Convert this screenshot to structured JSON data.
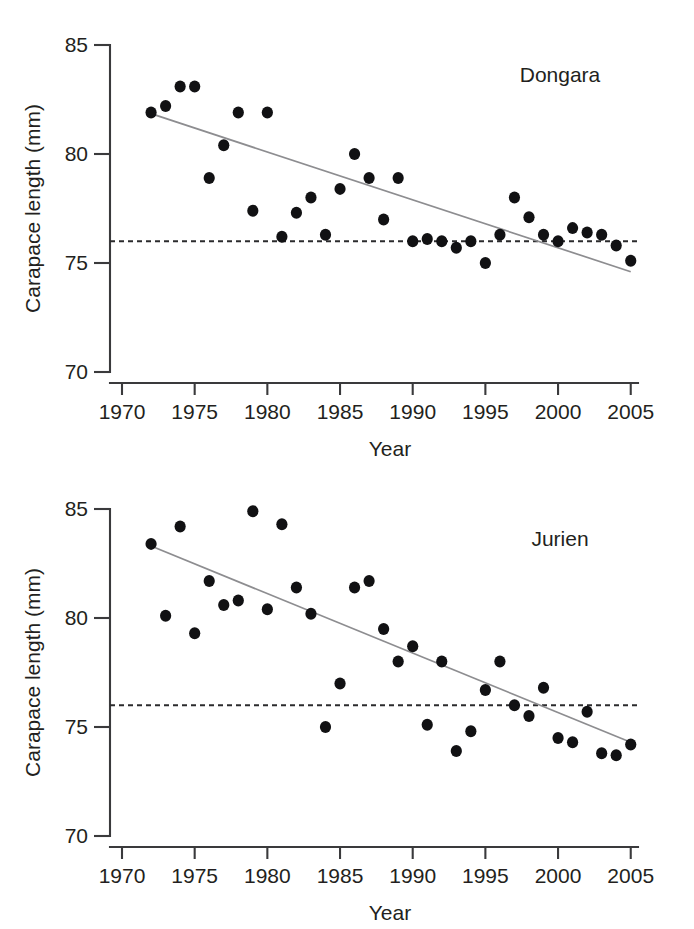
{
  "figure": {
    "background_color": "#ffffff",
    "point_color": "#111113",
    "trend_color": "#8d8d90",
    "reference_color": "#2b2b2d",
    "axis_color": "#3a3a3c"
  },
  "chart_data": [
    {
      "type": "scatter",
      "title": "Dongara",
      "xlabel": "Year",
      "ylabel": "Carapace length (mm)",
      "xlim": [
        1970,
        2005.5
      ],
      "ylim": [
        70,
        85
      ],
      "xticks": [
        1970,
        1975,
        1980,
        1985,
        1990,
        1995,
        2000,
        2005
      ],
      "xtick_labels": [
        "1970",
        "1975",
        "1980",
        "1985",
        "1990",
        "1995",
        "2000",
        "2005"
      ],
      "yticks": [
        70,
        75,
        80,
        85
      ],
      "ytick_labels": [
        "70",
        "75",
        "80",
        "85"
      ],
      "grid": false,
      "legend": "none",
      "x": [
        1972,
        1973,
        1974,
        1975,
        1976,
        1977,
        1978,
        1979,
        1980,
        1981,
        1982,
        1983,
        1984,
        1985,
        1986,
        1987,
        1988,
        1989,
        1990,
        1991,
        1992,
        1993,
        1994,
        1995,
        1996,
        1997,
        1998,
        1999,
        2000,
        2001,
        2002,
        2003,
        2004,
        2005
      ],
      "y": [
        81.9,
        82.2,
        83.1,
        83.1,
        78.9,
        80.4,
        81.9,
        77.4,
        81.9,
        76.2,
        77.3,
        78.0,
        76.3,
        78.4,
        80.0,
        78.9,
        77.0,
        78.9,
        76.0,
        76.1,
        76.0,
        75.7,
        76.0,
        75.0,
        76.3,
        78.0,
        77.1,
        76.3,
        76.0,
        76.6,
        76.4,
        76.3,
        75.8,
        75.1
      ],
      "trend_line": {
        "x": [
          1972,
          2005
        ],
        "y": [
          81.85,
          74.6
        ],
        "label": "linear regression"
      },
      "reference_line": {
        "y": 76.0,
        "style": "dashed",
        "label": "legal minimum size"
      }
    },
    {
      "type": "scatter",
      "title": "Jurien",
      "xlabel": "Year",
      "ylabel": "Carapace length (mm)",
      "xlim": [
        1970,
        2005.5
      ],
      "ylim": [
        70,
        85
      ],
      "xticks": [
        1970,
        1975,
        1980,
        1985,
        1990,
        1995,
        2000,
        2005
      ],
      "xtick_labels": [
        "1970",
        "1975",
        "1980",
        "1985",
        "1990",
        "1995",
        "2000",
        "2005"
      ],
      "yticks": [
        70,
        75,
        80,
        85
      ],
      "ytick_labels": [
        "70",
        "75",
        "80",
        "85"
      ],
      "grid": false,
      "legend": "none",
      "x": [
        1972,
        1973,
        1974,
        1975,
        1976,
        1977,
        1978,
        1979,
        1980,
        1981,
        1982,
        1983,
        1984,
        1985,
        1986,
        1987,
        1988,
        1989,
        1990,
        1991,
        1992,
        1993,
        1994,
        1995,
        1996,
        1997,
        1998,
        1999,
        2000,
        2001,
        2002,
        2003,
        2004,
        2005
      ],
      "y": [
        83.4,
        80.1,
        84.2,
        79.3,
        81.7,
        80.6,
        80.8,
        84.9,
        80.4,
        84.3,
        81.4,
        80.2,
        75.0,
        77.0,
        81.4,
        81.7,
        79.5,
        78.0,
        78.7,
        75.1,
        78.0,
        73.9,
        74.8,
        76.7,
        78.0,
        76.0,
        75.5,
        76.8,
        74.5,
        74.3,
        75.7,
        73.8,
        73.7,
        74.2
      ],
      "trend_line": {
        "x": [
          1972,
          2005
        ],
        "y": [
          83.3,
          74.3
        ],
        "label": "linear regression"
      },
      "reference_line": {
        "y": 76.0,
        "style": "dashed",
        "label": "legal minimum size"
      }
    }
  ]
}
